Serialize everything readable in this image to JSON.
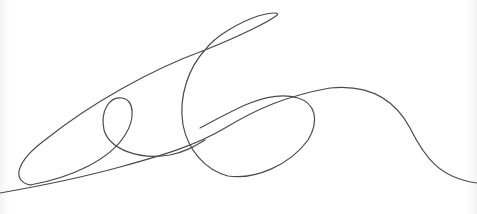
{
  "image": {
    "description": "Hand-drawn signature scribble on white background",
    "background_color": "#ffffff",
    "stroke_color": "#4a4a4a"
  },
  "signature": {
    "strokes": [
      {
        "name": "main-stroke",
        "path": "M 0 193 C 40 186, 80 178, 120 167 C 160 156, 195 146, 225 128 C 255 110, 285 96, 330 88 C 370 84, 395 100, 410 128 C 425 158, 440 178, 477 183"
      },
      {
        "name": "big-loop-stroke",
        "path": "M 30 185 C 10 180, 18 160, 45 140 C 90 104, 150 70, 205 50 C 240 36, 268 22, 276 16 C 282 12, 272 12, 258 16 C 240 22, 215 36, 205 50 C 190 66, 178 95, 183 125 C 188 150, 205 170, 228 176 C 255 180, 290 165, 308 140 C 320 120, 315 103, 298 98 C 285 94, 268 96, 250 103 C 235 109, 215 120, 200 128"
      },
      {
        "name": "small-loop-stroke",
        "path": "M 30 185 C 70 178, 110 160, 125 135 C 135 120, 135 100, 122 98 C 110 96, 100 110, 104 130 C 110 150, 140 160, 170 155 C 185 152, 195 146, 205 140"
      }
    ]
  }
}
